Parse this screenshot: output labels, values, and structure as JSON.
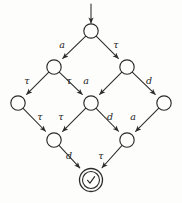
{
  "diagram": {
    "type": "labeled-transition-system",
    "title": "",
    "start_arrow": {
      "name": "initial-state-arrow",
      "from": [
        91,
        4
      ],
      "to": [
        91,
        23
      ]
    },
    "nodes": [
      {
        "id": "n0",
        "label": "",
        "cx": 91,
        "cy": 31,
        "r": 7.2,
        "accepting": false,
        "row": 0
      },
      {
        "id": "n1",
        "label": "",
        "cx": 54,
        "cy": 67,
        "r": 7.2,
        "accepting": false,
        "row": 1
      },
      {
        "id": "n2",
        "label": "",
        "cx": 127,
        "cy": 67,
        "r": 7.2,
        "accepting": false,
        "row": 1
      },
      {
        "id": "n3",
        "label": "",
        "cx": 18,
        "cy": 103,
        "r": 7.2,
        "accepting": false,
        "row": 2
      },
      {
        "id": "n4",
        "label": "",
        "cx": 91,
        "cy": 103,
        "r": 7.2,
        "accepting": false,
        "row": 2
      },
      {
        "id": "n5",
        "label": "",
        "cx": 164,
        "cy": 103,
        "r": 7.2,
        "accepting": false,
        "row": 2
      },
      {
        "id": "n6",
        "label": "",
        "cx": 54,
        "cy": 140,
        "r": 7.2,
        "accepting": false,
        "row": 3
      },
      {
        "id": "n7",
        "label": "",
        "cx": 127,
        "cy": 140,
        "r": 7.2,
        "accepting": false,
        "row": 3
      },
      {
        "id": "n8",
        "label": "✓",
        "cx": 91,
        "cy": 180,
        "r": 11.5,
        "accepting": true,
        "row": 4
      }
    ],
    "edges": [
      {
        "id": "e0",
        "from": "n0",
        "to": "n1",
        "label": "a",
        "label_x": 62,
        "label_y": 48
      },
      {
        "id": "e1",
        "from": "n0",
        "to": "n2",
        "label": "τ",
        "label_x": 116,
        "label_y": 48
      },
      {
        "id": "e2",
        "from": "n1",
        "to": "n3",
        "label": "τ",
        "label_x": 27,
        "label_y": 84
      },
      {
        "id": "e3",
        "from": "n1",
        "to": "n4",
        "label": "τ",
        "label_x": 69,
        "label_y": 84
      },
      {
        "id": "e4",
        "from": "n2",
        "to": "n4",
        "label": "a",
        "label_x": 86,
        "label_y": 84
      },
      {
        "id": "e5",
        "from": "n2",
        "to": "n5",
        "label": "d",
        "label_x": 149,
        "label_y": 84
      },
      {
        "id": "e6",
        "from": "n3",
        "to": "n6",
        "label": "τ",
        "label_x": 40,
        "label_y": 120
      },
      {
        "id": "e7",
        "from": "n4",
        "to": "n6",
        "label": "τ",
        "label_x": 61,
        "label_y": 120
      },
      {
        "id": "e8",
        "from": "n4",
        "to": "n7",
        "label": "d",
        "label_x": 110,
        "label_y": 120
      },
      {
        "id": "e9",
        "from": "n5",
        "to": "n7",
        "label": "a",
        "label_x": 133,
        "label_y": 120
      },
      {
        "id": "e10",
        "from": "n6",
        "to": "n8",
        "label": "d",
        "label_x": 69,
        "label_y": 159
      },
      {
        "id": "e11",
        "from": "n7",
        "to": "n8",
        "label": "τ",
        "label_x": 101,
        "label_y": 159
      }
    ],
    "colors": {
      "stroke": "#2b2b2b",
      "node_fill": "#fdfdfb",
      "background": "#fdfdfb",
      "label_text": "#242424"
    },
    "alphabet": [
      "a",
      "d",
      "τ"
    ]
  }
}
